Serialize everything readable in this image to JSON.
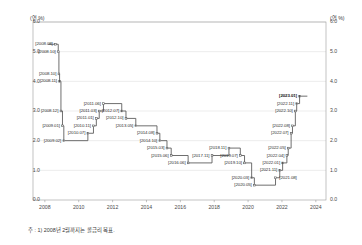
{
  "axes": {
    "unit_label_left": "(연 %)",
    "unit_label_right": "(연 %)",
    "y_ticks": [
      "6.0",
      "5.0",
      "4.0",
      "3.0",
      "2.0",
      "1.0",
      "0.0"
    ],
    "x_ticks": [
      "2008",
      "2010",
      "2012",
      "2014",
      "2016",
      "2018",
      "2020",
      "2022",
      "2024"
    ]
  },
  "footnote": "주 : 1) 2008년 2월까지는 콜금리 목표.",
  "colors": {
    "line": "#555555",
    "grid": "#d9d9d9",
    "axis": "#9a9a9a",
    "text": "#3a3a3a",
    "marker": "#555555"
  },
  "chart_data": {
    "type": "line",
    "title": "",
    "subtitle": "",
    "xlabel": "",
    "ylabel": "(연 %)",
    "ylim": [
      0.0,
      6.0
    ],
    "xlim": [
      2007.3,
      2024.6
    ],
    "grid": true,
    "legend": "none",
    "step": "post",
    "annotations": [
      "주 : 1) 2008년 2월까지는 콜금리 목표."
    ],
    "series": [
      {
        "name": "한국은행 기준금리",
        "points": [
          {
            "label": "[2008.08]",
            "date": "2008.08",
            "x": 2008.62,
            "value": 5.25,
            "side": "left"
          },
          {
            "label": "[2008.10]",
            "date": "2008.10",
            "x": 2008.79,
            "value": 5.0,
            "side": "left"
          },
          {
            "label": "[2008.10]",
            "date": "2008.10",
            "x": 2008.83,
            "value": 4.25,
            "side": "left"
          },
          {
            "label": "[2008.11]",
            "date": "2008.11",
            "x": 2008.87,
            "value": 4.0,
            "side": "left"
          },
          {
            "label": "[2008.12]",
            "date": "2008.12",
            "x": 2008.95,
            "value": 3.0,
            "side": "left"
          },
          {
            "label": "[2009.01]",
            "date": "2009.01",
            "x": 2009.04,
            "value": 2.5,
            "side": "left"
          },
          {
            "label": "[2009.02]",
            "date": "2009.02",
            "x": 2009.12,
            "value": 2.0,
            "side": "left"
          },
          {
            "label": "[2010.07]",
            "date": "2010.07",
            "x": 2010.54,
            "value": 2.25,
            "side": "left"
          },
          {
            "label": "[2010.11]",
            "date": "2010.11",
            "x": 2010.87,
            "value": 2.5,
            "side": "left"
          },
          {
            "label": "[2011.01]",
            "date": "2011.01",
            "x": 2011.04,
            "value": 2.75,
            "side": "left"
          },
          {
            "label": "[2011.03]",
            "date": "2011.03",
            "x": 2011.21,
            "value": 3.0,
            "side": "left"
          },
          {
            "label": "[2011.06]",
            "date": "2011.06",
            "x": 2011.46,
            "value": 3.25,
            "side": "left"
          },
          {
            "label": "[2012.07]",
            "date": "2012.07",
            "x": 2012.54,
            "value": 3.0,
            "side": "left"
          },
          {
            "label": "[2012.10]",
            "date": "2012.10",
            "x": 2012.79,
            "value": 2.75,
            "side": "left"
          },
          {
            "label": "[2013.05]",
            "date": "2013.05",
            "x": 2013.37,
            "value": 2.5,
            "side": "left"
          },
          {
            "label": "[2014.08]",
            "date": "2014.08",
            "x": 2014.62,
            "value": 2.25,
            "side": "left"
          },
          {
            "label": "[2014.10]",
            "date": "2014.10",
            "x": 2014.79,
            "value": 2.0,
            "side": "left"
          },
          {
            "label": "[2015.03]",
            "date": "2015.03",
            "x": 2015.21,
            "value": 1.75,
            "side": "left"
          },
          {
            "label": "[2015.06]",
            "date": "2015.06",
            "x": 2015.46,
            "value": 1.5,
            "side": "left"
          },
          {
            "label": "[2016.06]",
            "date": "2016.06",
            "x": 2016.46,
            "value": 1.25,
            "side": "left"
          },
          {
            "label": "[2017.11]",
            "date": "2017.11",
            "x": 2017.87,
            "value": 1.5,
            "side": "left"
          },
          {
            "label": "[2018.11]",
            "date": "2018.11",
            "x": 2018.87,
            "value": 1.75,
            "side": "left"
          },
          {
            "label": "[2019.07]",
            "date": "2019.07",
            "x": 2019.54,
            "value": 1.5,
            "side": "left"
          },
          {
            "label": "[2019.10]",
            "date": "2019.10",
            "x": 2019.79,
            "value": 1.25,
            "side": "left"
          },
          {
            "label": "[2020.03]",
            "date": "2020.03",
            "x": 2020.21,
            "value": 0.75,
            "side": "left"
          },
          {
            "label": "[2020.05]",
            "date": "2020.05",
            "x": 2020.37,
            "value": 0.5,
            "side": "left"
          },
          {
            "label": "[2021.08]",
            "date": "2021.08",
            "x": 2021.62,
            "value": 0.75,
            "side": "right"
          },
          {
            "label": "[2021.11]",
            "date": "2021.11",
            "x": 2021.87,
            "value": 1.0,
            "side": "left"
          },
          {
            "label": "[2022.01]",
            "date": "2022.01",
            "x": 2022.04,
            "value": 1.25,
            "side": "left"
          },
          {
            "label": "[2022.04]",
            "date": "2022.04",
            "x": 2022.29,
            "value": 1.5,
            "side": "left"
          },
          {
            "label": "[2022.05]",
            "date": "2022.05",
            "x": 2022.37,
            "value": 1.75,
            "side": "left"
          },
          {
            "label": "[2022.07]",
            "date": "2022.07",
            "x": 2022.54,
            "value": 2.25,
            "side": "left"
          },
          {
            "label": "[2022.08]",
            "date": "2022.08",
            "x": 2022.62,
            "value": 2.5,
            "side": "left"
          },
          {
            "label": "[2022.10]",
            "date": "2022.10",
            "x": 2022.79,
            "value": 3.0,
            "side": "left"
          },
          {
            "label": "[2022.11]",
            "date": "2022.11",
            "x": 2022.87,
            "value": 3.25,
            "side": "left"
          },
          {
            "label": "[2023.01]",
            "date": "2023.01",
            "x": 2023.04,
            "value": 3.5,
            "side": "left",
            "current": true
          }
        ],
        "end_x": 2023.5
      }
    ]
  }
}
